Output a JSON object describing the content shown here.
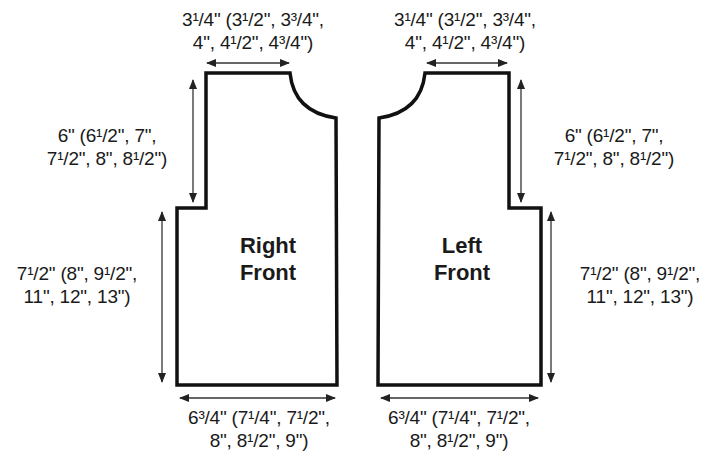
{
  "diagram": {
    "type": "knitting-schematic",
    "pieces": [
      {
        "name": "Right Front",
        "label_lines": [
          "Right",
          "Front"
        ],
        "dimensions": {
          "shoulder_width": {
            "lines": [
              "3¹/4\" (3¹/2\", 3³/4\",",
              "4\", 4¹/2\", 4³/4\")"
            ]
          },
          "armhole_depth": {
            "lines": [
              "6\" (6¹/2\", 7\",",
              "7¹/2\", 8\", 8¹/2\")"
            ]
          },
          "length_to_armhole": {
            "lines": [
              "7¹/2\" (8\", 9¹/2\",",
              "11\", 12\", 13\")"
            ]
          },
          "bottom_width": {
            "lines": [
              "6³/4\" (7¹/4\", 7¹/2\",",
              "8\", 8¹/2\", 9\")"
            ]
          }
        }
      },
      {
        "name": "Left Front",
        "label_lines": [
          "Left",
          "Front"
        ],
        "dimensions": {
          "shoulder_width": {
            "lines": [
              "3¹/4\" (3¹/2\", 3³/4\",",
              "4\", 4¹/2\", 4³/4\")"
            ]
          },
          "armhole_depth": {
            "lines": [
              "6\" (6¹/2\", 7\",",
              "7¹/2\", 8\", 8¹/2\")"
            ]
          },
          "length_to_armhole": {
            "lines": [
              "7¹/2\" (8\", 9¹/2\",",
              "11\", 12\", 13\")"
            ]
          },
          "bottom_width": {
            "lines": [
              "6³/4\" (7¹/4\", 7¹/2\",",
              "8\", 8¹/2\", 9\")"
            ]
          }
        }
      }
    ],
    "colors": {
      "outline": "#111111",
      "arrow": "#333333",
      "text": "#1a1a1a",
      "background": "#ffffff"
    }
  }
}
